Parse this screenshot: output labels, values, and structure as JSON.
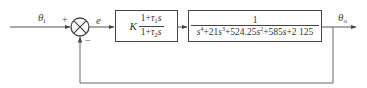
{
  "diagram": {
    "type": "feedback-control-block-diagram",
    "signals": {
      "input": {
        "symbol": "θ",
        "subscript": "i"
      },
      "error": {
        "symbol": "e"
      },
      "output": {
        "symbol": "θ",
        "subscript": "o"
      }
    },
    "summing_junction": {
      "plus_sign": "+",
      "minus_sign": "−"
    },
    "blocks": [
      {
        "id": "controller",
        "gain": "K",
        "numerator": {
          "prefix": "1+",
          "tau": "τ",
          "tau_sub": "1",
          "var": "s"
        },
        "denominator": {
          "prefix": "1+",
          "tau": "τ",
          "tau_sub": "2",
          "var": "s"
        }
      },
      {
        "id": "plant",
        "numerator": "1",
        "denominator_terms": [
          {
            "coef": "",
            "var": "s",
            "exp": "4"
          },
          {
            "coef": "+21",
            "var": "s",
            "exp": "3"
          },
          {
            "coef": "+524.25",
            "var": "s",
            "exp": "2"
          },
          {
            "coef": "+585",
            "var": "s",
            "exp": ""
          },
          {
            "coef": "+2 125",
            "var": "",
            "exp": ""
          }
        ]
      }
    ],
    "feedback": "unity negative feedback"
  },
  "colors": {
    "line": "#444444",
    "background": "#ffffff"
  }
}
